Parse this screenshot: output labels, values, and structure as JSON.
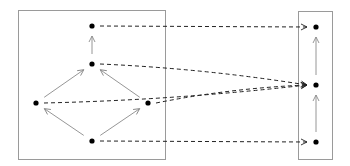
{
  "diagram": {
    "type": "directed-graph-mapping",
    "colors": {
      "box_stroke": "#9a9a9a",
      "node_fill": "#000000",
      "solid_arrow": "#8a8a8a",
      "dashed_arrow": "#222222"
    },
    "boxes": [
      {
        "id": "left-box",
        "x": 18,
        "y": 10,
        "w": 147,
        "h": 149
      },
      {
        "id": "right-box",
        "x": 298,
        "y": 11,
        "w": 34,
        "h": 148
      }
    ],
    "nodes": [
      {
        "id": "L-top",
        "x": 92,
        "y": 26
      },
      {
        "id": "L-mid",
        "x": 92,
        "y": 64
      },
      {
        "id": "L-left",
        "x": 36,
        "y": 103
      },
      {
        "id": "L-right",
        "x": 148,
        "y": 103
      },
      {
        "id": "L-bottom",
        "x": 92,
        "y": 141
      },
      {
        "id": "R-top",
        "x": 316,
        "y": 27
      },
      {
        "id": "R-mid",
        "x": 316,
        "y": 85
      },
      {
        "id": "R-bottom",
        "x": 316,
        "y": 142
      }
    ],
    "solid_edges": [
      {
        "from": "L-mid",
        "to": "L-top"
      },
      {
        "from": "L-left",
        "to": "L-mid"
      },
      {
        "from": "L-right",
        "to": "L-mid"
      },
      {
        "from": "L-bottom",
        "to": "L-left"
      },
      {
        "from": "L-bottom",
        "to": "L-right"
      },
      {
        "from": "R-mid",
        "to": "R-top"
      },
      {
        "from": "R-bottom",
        "to": "R-mid"
      }
    ],
    "dashed_edges": [
      {
        "from": "L-top",
        "to": "R-top",
        "curve": 0
      },
      {
        "from": "L-mid",
        "to": "R-mid",
        "curve": 1
      },
      {
        "from": "L-left",
        "to": "R-mid",
        "curve": -1
      },
      {
        "from": "L-right",
        "to": "R-mid",
        "curve": 1
      },
      {
        "from": "L-bottom",
        "to": "R-bottom",
        "curve": 0
      }
    ]
  }
}
